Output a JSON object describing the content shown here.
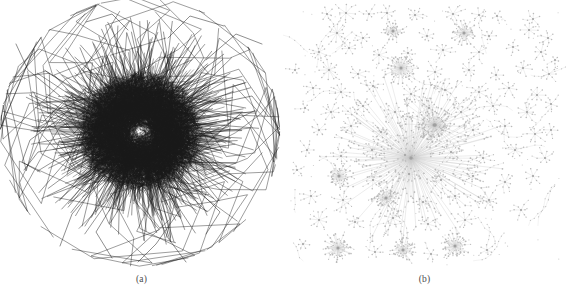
{
  "figure": {
    "background_color": "#ffffff",
    "width": 566,
    "height": 305,
    "panel_count": 2
  },
  "panels": [
    {
      "id": "panel-a",
      "caption": "(a)",
      "layout_type": "force-directed-hairball",
      "edge_color": "#1a1a1a",
      "node_color": "#000000",
      "description": "dense hairball network drawing with heavy edge overlap",
      "center_x": 140,
      "center_y": 132,
      "core_radius": 62,
      "halo_radius": 118,
      "core_edge_count": 2600,
      "halo_edge_count": 260,
      "periphery_edge_count": 70
    },
    {
      "id": "panel-b",
      "caption": "(b)",
      "layout_type": "hub-and-spoke-radial",
      "edge_color": "#c8c8c8",
      "node_color": "#b4b4b4",
      "hub_color": "#a0a0a0",
      "description": "sparse radial hub and spoke network drawing with separated clusters",
      "hub_count": 96,
      "leaf_per_hub_min": 3,
      "leaf_per_hub_max": 26,
      "big_hub_count": 8
    }
  ],
  "chart_data": {
    "type": "scatter",
    "title": "",
    "xlabel": "",
    "ylabel": "",
    "subplots": [
      {
        "name": "(a)",
        "kind": "graph-drawing",
        "style": "hairball",
        "xlim": [
          0,
          283
        ],
        "ylim": [
          0,
          275
        ],
        "grid": false,
        "legend": "none"
      },
      {
        "name": "(b)",
        "kind": "graph-drawing",
        "style": "radial-hub",
        "xlim": [
          0,
          283
        ],
        "ylim": [
          0,
          275
        ],
        "grid": false,
        "legend": "none"
      }
    ],
    "panel_b_hubs": [
      {
        "x": 44,
        "y": 14,
        "r": 7,
        "n": 6,
        "big": false
      },
      {
        "x": 63,
        "y": 13,
        "r": 9,
        "n": 8,
        "big": false
      },
      {
        "x": 86,
        "y": 14,
        "r": 7,
        "n": 6,
        "big": false
      },
      {
        "x": 104,
        "y": 13,
        "r": 8,
        "n": 7,
        "big": false
      },
      {
        "x": 132,
        "y": 15,
        "r": 8,
        "n": 9,
        "big": false
      },
      {
        "x": 170,
        "y": 14,
        "r": 9,
        "n": 8,
        "big": false
      },
      {
        "x": 196,
        "y": 15,
        "r": 7,
        "n": 6,
        "big": false
      },
      {
        "x": 214,
        "y": 16,
        "r": 6,
        "n": 5,
        "big": false
      },
      {
        "x": 250,
        "y": 19,
        "r": 7,
        "n": 6,
        "big": false
      },
      {
        "x": 54,
        "y": 33,
        "r": 11,
        "n": 12,
        "big": false
      },
      {
        "x": 80,
        "y": 38,
        "r": 8,
        "n": 7,
        "big": false
      },
      {
        "x": 110,
        "y": 31,
        "r": 10,
        "n": 14,
        "big": true
      },
      {
        "x": 144,
        "y": 36,
        "r": 8,
        "n": 8,
        "big": false
      },
      {
        "x": 181,
        "y": 33,
        "r": 13,
        "n": 18,
        "big": true
      },
      {
        "x": 206,
        "y": 36,
        "r": 7,
        "n": 6,
        "big": false
      },
      {
        "x": 246,
        "y": 30,
        "r": 9,
        "n": 8,
        "big": false
      },
      {
        "x": 265,
        "y": 38,
        "r": 7,
        "n": 6,
        "big": false
      },
      {
        "x": 36,
        "y": 52,
        "r": 9,
        "n": 8,
        "big": false
      },
      {
        "x": 66,
        "y": 48,
        "r": 8,
        "n": 7,
        "big": false
      },
      {
        "x": 96,
        "y": 55,
        "r": 9,
        "n": 9,
        "big": false
      },
      {
        "x": 125,
        "y": 53,
        "r": 8,
        "n": 7,
        "big": false
      },
      {
        "x": 160,
        "y": 50,
        "r": 9,
        "n": 9,
        "big": false
      },
      {
        "x": 196,
        "y": 52,
        "r": 8,
        "n": 7,
        "big": false
      },
      {
        "x": 230,
        "y": 47,
        "r": 7,
        "n": 6,
        "big": false
      },
      {
        "x": 258,
        "y": 52,
        "r": 8,
        "n": 7,
        "big": false
      },
      {
        "x": 46,
        "y": 70,
        "r": 11,
        "n": 13,
        "big": false
      },
      {
        "x": 75,
        "y": 74,
        "r": 8,
        "n": 7,
        "big": false
      },
      {
        "x": 118,
        "y": 68,
        "r": 17,
        "n": 24,
        "big": true
      },
      {
        "x": 152,
        "y": 72,
        "r": 8,
        "n": 8,
        "big": false
      },
      {
        "x": 186,
        "y": 70,
        "r": 9,
        "n": 9,
        "big": false
      },
      {
        "x": 213,
        "y": 75,
        "r": 8,
        "n": 7,
        "big": false
      },
      {
        "x": 240,
        "y": 68,
        "r": 9,
        "n": 8,
        "big": false
      },
      {
        "x": 266,
        "y": 74,
        "r": 8,
        "n": 7,
        "big": false
      },
      {
        "x": 30,
        "y": 88,
        "r": 7,
        "n": 6,
        "big": false
      },
      {
        "x": 58,
        "y": 92,
        "r": 9,
        "n": 9,
        "big": false
      },
      {
        "x": 90,
        "y": 86,
        "r": 8,
        "n": 7,
        "big": false
      },
      {
        "x": 128,
        "y": 94,
        "r": 9,
        "n": 9,
        "big": false
      },
      {
        "x": 162,
        "y": 90,
        "r": 8,
        "n": 8,
        "big": false
      },
      {
        "x": 196,
        "y": 92,
        "r": 9,
        "n": 8,
        "big": false
      },
      {
        "x": 226,
        "y": 88,
        "r": 8,
        "n": 7,
        "big": false
      },
      {
        "x": 254,
        "y": 95,
        "r": 9,
        "n": 8,
        "big": false
      },
      {
        "x": 22,
        "y": 108,
        "r": 6,
        "n": 5,
        "big": false
      },
      {
        "x": 48,
        "y": 112,
        "r": 9,
        "n": 9,
        "big": false
      },
      {
        "x": 80,
        "y": 106,
        "r": 8,
        "n": 7,
        "big": false
      },
      {
        "x": 112,
        "y": 112,
        "r": 9,
        "n": 9,
        "big": false
      },
      {
        "x": 146,
        "y": 108,
        "r": 10,
        "n": 11,
        "big": false
      },
      {
        "x": 178,
        "y": 112,
        "r": 8,
        "n": 7,
        "big": false
      },
      {
        "x": 210,
        "y": 106,
        "r": 9,
        "n": 8,
        "big": false
      },
      {
        "x": 244,
        "y": 112,
        "r": 10,
        "n": 10,
        "big": false
      },
      {
        "x": 268,
        "y": 104,
        "r": 7,
        "n": 6,
        "big": false
      },
      {
        "x": 36,
        "y": 130,
        "r": 8,
        "n": 7,
        "big": false
      },
      {
        "x": 68,
        "y": 126,
        "r": 9,
        "n": 9,
        "big": false
      },
      {
        "x": 98,
        "y": 132,
        "r": 8,
        "n": 7,
        "big": false
      },
      {
        "x": 151,
        "y": 125,
        "r": 18,
        "n": 26,
        "big": true
      },
      {
        "x": 190,
        "y": 130,
        "r": 9,
        "n": 9,
        "big": false
      },
      {
        "x": 222,
        "y": 126,
        "r": 8,
        "n": 7,
        "big": false
      },
      {
        "x": 252,
        "y": 134,
        "r": 9,
        "n": 8,
        "big": false
      },
      {
        "x": 24,
        "y": 150,
        "r": 7,
        "n": 6,
        "big": false
      },
      {
        "x": 58,
        "y": 156,
        "r": 9,
        "n": 9,
        "big": false
      },
      {
        "x": 89,
        "y": 150,
        "r": 10,
        "n": 11,
        "big": false
      },
      {
        "x": 122,
        "y": 155,
        "r": 9,
        "n": 9,
        "big": false
      },
      {
        "x": 168,
        "y": 152,
        "r": 10,
        "n": 10,
        "big": false
      },
      {
        "x": 200,
        "y": 158,
        "r": 8,
        "n": 7,
        "big": false
      },
      {
        "x": 232,
        "y": 150,
        "r": 9,
        "n": 8,
        "big": false
      },
      {
        "x": 262,
        "y": 158,
        "r": 8,
        "n": 7,
        "big": false
      },
      {
        "x": 56,
        "y": 176,
        "r": 13,
        "n": 16,
        "big": true
      },
      {
        "x": 90,
        "y": 180,
        "r": 9,
        "n": 9,
        "big": false
      },
      {
        "x": 126,
        "y": 174,
        "r": 10,
        "n": 11,
        "big": false
      },
      {
        "x": 158,
        "y": 180,
        "r": 9,
        "n": 9,
        "big": false
      },
      {
        "x": 190,
        "y": 176,
        "r": 8,
        "n": 7,
        "big": false
      },
      {
        "x": 222,
        "y": 182,
        "r": 9,
        "n": 8,
        "big": false
      },
      {
        "x": 28,
        "y": 196,
        "r": 8,
        "n": 7,
        "big": false
      },
      {
        "x": 60,
        "y": 200,
        "r": 9,
        "n": 9,
        "big": false
      },
      {
        "x": 103,
        "y": 198,
        "r": 14,
        "n": 20,
        "big": true
      },
      {
        "x": 140,
        "y": 202,
        "r": 9,
        "n": 9,
        "big": false
      },
      {
        "x": 172,
        "y": 196,
        "r": 8,
        "n": 7,
        "big": false
      },
      {
        "x": 206,
        "y": 200,
        "r": 9,
        "n": 8,
        "big": false
      },
      {
        "x": 36,
        "y": 220,
        "r": 9,
        "n": 9,
        "big": false
      },
      {
        "x": 72,
        "y": 222,
        "r": 8,
        "n": 7,
        "big": false
      },
      {
        "x": 110,
        "y": 218,
        "r": 9,
        "n": 9,
        "big": false
      },
      {
        "x": 145,
        "y": 224,
        "r": 8,
        "n": 7,
        "big": false
      },
      {
        "x": 182,
        "y": 220,
        "r": 9,
        "n": 8,
        "big": false
      },
      {
        "x": 55,
        "y": 248,
        "r": 15,
        "n": 22,
        "big": true
      },
      {
        "x": 120,
        "y": 250,
        "r": 13,
        "n": 17,
        "big": true
      },
      {
        "x": 172,
        "y": 246,
        "r": 15,
        "n": 21,
        "big": true
      },
      {
        "x": 20,
        "y": 244,
        "r": 7,
        "n": 6,
        "big": false
      },
      {
        "x": 92,
        "y": 252,
        "r": 7,
        "n": 6,
        "big": false
      },
      {
        "x": 148,
        "y": 254,
        "r": 7,
        "n": 6,
        "big": false
      },
      {
        "x": 204,
        "y": 250,
        "r": 7,
        "n": 6,
        "big": false
      },
      {
        "x": 238,
        "y": 210,
        "r": 7,
        "n": 6,
        "big": false
      },
      {
        "x": 250,
        "y": 176,
        "r": 8,
        "n": 7,
        "big": false
      },
      {
        "x": 268,
        "y": 130,
        "r": 7,
        "n": 6,
        "big": false
      },
      {
        "x": 12,
        "y": 70,
        "r": 6,
        "n": 5,
        "big": false
      },
      {
        "x": 14,
        "y": 170,
        "r": 6,
        "n": 5,
        "big": false
      },
      {
        "x": 272,
        "y": 60,
        "r": 6,
        "n": 5,
        "big": false
      }
    ],
    "panel_b_superhub": {
      "x": 128,
      "y": 158,
      "r": 78,
      "spokes": 150
    },
    "panel_b_superhub2": {
      "x": 152,
      "y": 125,
      "r": 34,
      "spokes": 40
    }
  }
}
